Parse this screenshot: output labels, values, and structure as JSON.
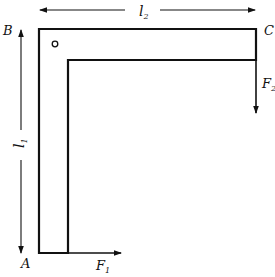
{
  "diagram": {
    "type": "L-shaped frame with applied forces",
    "stroke_color": "#111111",
    "background": "#ffffff",
    "points": {
      "A": {
        "label": "A",
        "x": 39,
        "y": 253
      },
      "B": {
        "label": "B",
        "x": 39,
        "y": 29
      },
      "C": {
        "label": "C",
        "x": 256,
        "y": 29
      }
    },
    "dimensions": {
      "l1": {
        "label": "l",
        "subscript": "1",
        "description": "vertical length from A to B"
      },
      "l2": {
        "label": "l",
        "subscript": "2",
        "description": "horizontal length from B to C"
      }
    },
    "forces": {
      "F1": {
        "label": "F",
        "subscript": "1",
        "direction": "right",
        "applied_at": "A"
      },
      "F2": {
        "label": "F",
        "subscript": "2",
        "direction": "down",
        "applied_at": "C"
      }
    },
    "marker": {
      "name": "pivot-circle",
      "x": 55,
      "y": 44
    }
  }
}
